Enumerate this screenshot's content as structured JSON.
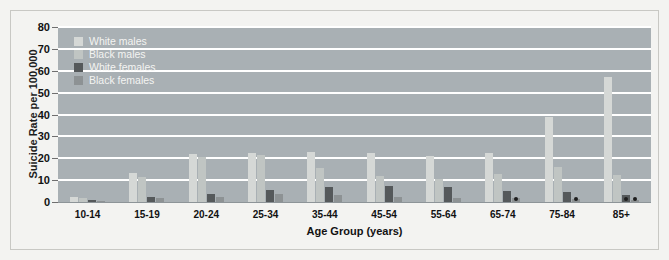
{
  "chart_data": {
    "type": "bar",
    "title": "",
    "xlabel": "Age Group (years)",
    "ylabel": "Suicide Rate per 100,000",
    "categories": [
      "10-14",
      "15-19",
      "20-24",
      "25-34",
      "35-44",
      "45-54",
      "55-64",
      "65-74",
      "75-84",
      "85+"
    ],
    "ylim": [
      0,
      80
    ],
    "yticks": [
      0,
      10,
      20,
      30,
      40,
      50,
      60,
      70,
      80
    ],
    "ytick_labels": [
      "0",
      "10",
      "20",
      "30",
      "40",
      "50",
      "60",
      "70",
      "80"
    ],
    "grid": true,
    "legend_position": "top-left",
    "series": [
      {
        "name": "White males",
        "color": "#d5d8d6",
        "values": [
          2.5,
          13.2,
          22.0,
          22.5,
          23.0,
          22.5,
          21.0,
          22.5,
          39.0,
          57.0
        ]
      },
      {
        "name": "Black males",
        "color": "#c0c5c3",
        "values": [
          2.0,
          11.5,
          20.5,
          21.5,
          15.5,
          12.0,
          10.5,
          13.0,
          16.0,
          12.5
        ]
      },
      {
        "name": "White females",
        "color": "#55595b",
        "values": [
          0.8,
          2.2,
          3.8,
          5.5,
          7.0,
          7.5,
          7.0,
          5.2,
          4.5,
          3.0
        ]
      },
      {
        "name": "Black females",
        "color": "#8d9294",
        "values": [
          0.5,
          1.8,
          2.5,
          3.5,
          3.2,
          2.5,
          2.0,
          1.8,
          1.2,
          1.0
        ]
      }
    ],
    "marked_near_zero": [
      {
        "group": "65-74",
        "series": "Black females"
      },
      {
        "group": "75-84",
        "series": "Black females"
      },
      {
        "group": "85+",
        "series": "White females"
      },
      {
        "group": "85+",
        "series": "Black females"
      }
    ],
    "colors": {
      "plot_background": "#a9b0b4",
      "figure_background": "#f3f3f1",
      "gridline": "#ffffff",
      "text": "#111111",
      "legend_text": "#f4f4f2"
    }
  }
}
